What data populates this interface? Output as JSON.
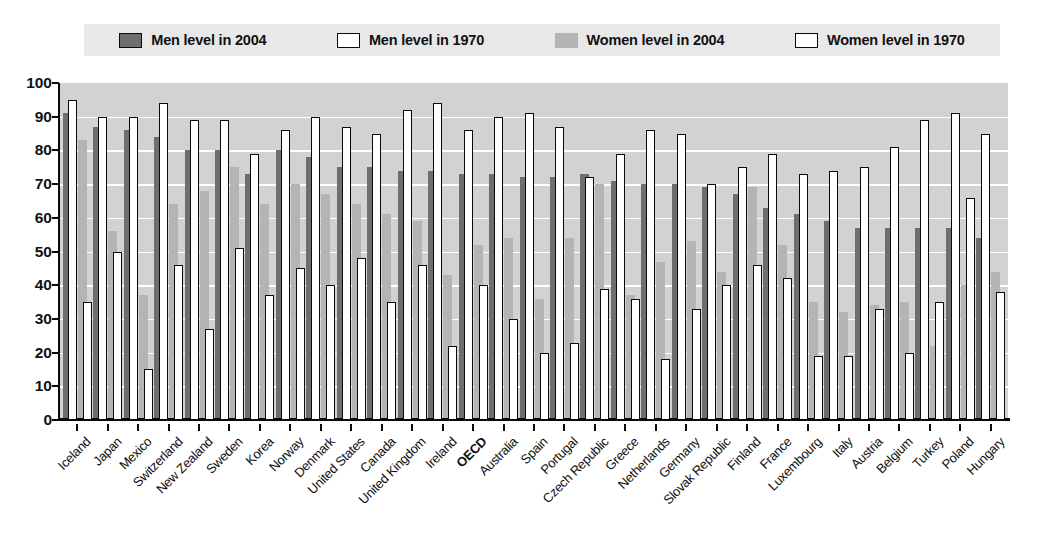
{
  "legend": {
    "items": [
      {
        "label": "Men level in 2004",
        "key": "men_2004",
        "color": "#6e6e6e",
        "style": "filled"
      },
      {
        "label": "Men level in 1970",
        "key": "men_1970",
        "color": "#ffffff",
        "style": "outline"
      },
      {
        "label": "Women level in 2004",
        "key": "women_2004",
        "color": "#b4b4b4",
        "style": "filled"
      },
      {
        "label": "Women level in 1970",
        "key": "women_1970",
        "color": "#ffffff",
        "style": "outline"
      }
    ]
  },
  "axis": {
    "y_ticks": [
      "0",
      "10",
      "20",
      "30",
      "40",
      "50",
      "60",
      "70",
      "80",
      "90",
      "100"
    ]
  },
  "chart_data": {
    "type": "bar",
    "title": "",
    "xlabel": "",
    "ylabel": "",
    "ylim": [
      0,
      100
    ],
    "ytick_step": 10,
    "grid": true,
    "legend_position": "top",
    "categories": [
      "Iceland",
      "Japan",
      "Mexico",
      "Switzerland",
      "New Zealand",
      "Sweden",
      "Korea",
      "Norway",
      "Denmark",
      "United States",
      "Canada",
      "United Kingdom",
      "Ireland",
      "OECD",
      "Australia",
      "Spain",
      "Portugal",
      "Czech Republic",
      "Greece",
      "Netherlands",
      "Germany",
      "Slovak Republic",
      "Finland",
      "France",
      "Luxembourg",
      "Italy",
      "Austria",
      "Belgium",
      "Turkey",
      "Poland",
      "Hungary"
    ],
    "highlight_category": "OECD",
    "series": [
      {
        "name": "Men level in 2004",
        "key": "men_2004",
        "color": "#6e6e6e",
        "style": "filled",
        "values": [
          91,
          87,
          86,
          84,
          80,
          80,
          73,
          80,
          78,
          75,
          75,
          74,
          74,
          73,
          73,
          72,
          72,
          73,
          71,
          70,
          70,
          69,
          67,
          63,
          61,
          59,
          57,
          57,
          57,
          57,
          54
        ]
      },
      {
        "name": "Men level in 1970",
        "key": "men_1970",
        "color": "#ffffff",
        "style": "outline",
        "values": [
          95,
          90,
          90,
          94,
          89,
          89,
          79,
          86,
          90,
          87,
          85,
          92,
          94,
          86,
          90,
          91,
          87,
          72,
          79,
          86,
          85,
          70,
          75,
          79,
          73,
          74,
          75,
          81,
          89,
          91,
          85
        ]
      },
      {
        "name": "Women level in 2004",
        "key": "women_2004",
        "color": "#b4b4b4",
        "style": "filled",
        "values": [
          83,
          56,
          37,
          64,
          68,
          75,
          64,
          70,
          67,
          64,
          61,
          59,
          43,
          52,
          54,
          36,
          54,
          70,
          37,
          47,
          53,
          44,
          69,
          52,
          35,
          32,
          34,
          35,
          22,
          40,
          44
        ]
      },
      {
        "name": "Women level in 1970",
        "key": "women_1970",
        "color": "#ffffff",
        "style": "outline",
        "values": [
          35,
          50,
          15,
          46,
          27,
          51,
          37,
          45,
          40,
          48,
          35,
          46,
          22,
          40,
          30,
          20,
          23,
          39,
          36,
          18,
          33,
          40,
          46,
          42,
          19,
          19,
          33,
          20,
          35,
          66,
          38
        ]
      }
    ]
  }
}
